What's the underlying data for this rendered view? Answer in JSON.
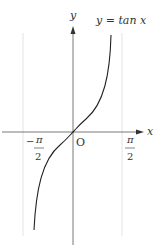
{
  "figure": {
    "function_label": "y = tan x",
    "y_axis_label": "y",
    "x_axis_label": "x",
    "origin_label": "O",
    "left_asymptote": {
      "numerator": "π",
      "denominator": "2",
      "sign": "−"
    },
    "right_asymptote": {
      "numerator": "π",
      "denominator": "2",
      "sign": ""
    }
  }
}
